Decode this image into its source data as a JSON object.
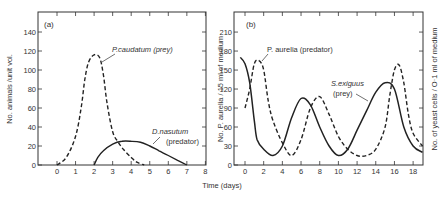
{
  "figure": {
    "xlabel": "Time (days)"
  },
  "chart_data": [
    {
      "type": "line",
      "panel_label": "(a)",
      "title": "",
      "xlabel": "Time (days)",
      "ylabel": "No. animals / unit vol.",
      "xlim": [
        -1,
        8
      ],
      "ylim": [
        0,
        160
      ],
      "xticks": [
        0,
        1,
        2,
        3,
        4,
        5,
        6,
        7,
        8
      ],
      "yticks": [
        0,
        20,
        40,
        60,
        80,
        100,
        120,
        140
      ],
      "grid": false,
      "series": [
        {
          "name": "P. caudatum (prey)",
          "style": "dashed",
          "x": [
            0,
            0.5,
            1.0,
            1.3,
            1.5,
            1.7,
            2.0,
            2.3,
            2.5,
            2.7,
            3.0,
            3.3,
            3.6,
            4.0,
            4.3,
            4.7
          ],
          "y": [
            0,
            8,
            30,
            60,
            90,
            108,
            116,
            113,
            95,
            65,
            35,
            24,
            16,
            8,
            3,
            0
          ]
        },
        {
          "name": "D. nasutum (predator)",
          "style": "solid",
          "x": [
            2.0,
            2.2,
            2.5,
            3.0,
            3.5,
            4.0,
            4.5,
            5.0,
            5.5,
            6.0,
            6.5,
            7.0
          ],
          "y": [
            0,
            8,
            15,
            22,
            25,
            25,
            24,
            20,
            15,
            10,
            5,
            0
          ]
        }
      ],
      "annotations": [
        {
          "text": "P. caudatum (prey)",
          "x": 3.0,
          "y": 120
        },
        {
          "text": "D. nasutum",
          "x": 5.5,
          "y": 30
        },
        {
          "text": "(predator)",
          "x": 6.0,
          "y": 21
        }
      ]
    },
    {
      "type": "line",
      "panel_label": "(b)",
      "title": "",
      "xlabel": "Time (days)",
      "ylabel": "No. P. aurelia / 15 ml of medium",
      "ylabel_right": "No. of yeast cells / 0·1 ml of medium",
      "xlim": [
        -1,
        19
      ],
      "ylim": [
        0,
        240
      ],
      "xticks": [
        0,
        2,
        4,
        6,
        8,
        10,
        12,
        14,
        16,
        18
      ],
      "yticks": [
        0,
        30,
        60,
        90,
        120,
        150,
        180,
        210
      ],
      "grid": false,
      "series": [
        {
          "name": "P. aurelia (predator)",
          "style": "solid",
          "x": [
            0,
            0.5,
            1.0,
            1.5,
            2.0,
            2.5,
            3.0,
            4.0,
            5.0,
            6.0,
            7.0,
            8.0,
            9.0,
            10.0,
            11.0,
            12.0,
            13.0,
            14.0,
            15.0,
            15.5,
            16.0,
            16.5,
            17.0,
            17.5,
            18.0,
            19.0
          ],
          "y": [
            90,
            120,
            160,
            165,
            150,
            100,
            70,
            35,
            15,
            40,
            90,
            108,
            80,
            45,
            25,
            15,
            15,
            25,
            60,
            110,
            150,
            158,
            130,
            80,
            50,
            30
          ]
        },
        {
          "name": "S. exiguus (prey)",
          "style": "dashed",
          "x": [
            -0.5,
            0,
            0.5,
            1.0,
            1.3,
            2.0,
            3.0,
            4.0,
            5.0,
            6.0,
            7.0,
            8.0,
            9.0,
            10.0,
            11.0,
            12.0,
            13.0,
            14.0,
            15.0,
            16.0,
            17.0,
            18.0,
            19.0
          ],
          "y": [
            170,
            160,
            130,
            70,
            40,
            25,
            15,
            30,
            75,
            105,
            95,
            60,
            30,
            15,
            25,
            55,
            85,
            115,
            130,
            120,
            60,
            30,
            20
          ]
        }
      ],
      "annotations": [
        {
          "text": "P. aurelia (predator)",
          "x": 3.5,
          "y": 180
        },
        {
          "text": "S. exiguus",
          "x": 15.0,
          "y": 115
        },
        {
          "text": "(prey)",
          "x": 14.5,
          "y": 100
        }
      ]
    }
  ],
  "panels": {
    "a": {
      "label": "(a)",
      "ylabel": "No. animals /unit vol.",
      "yticks": [
        "0",
        "20",
        "40",
        "60",
        "80",
        "100",
        "120",
        "140"
      ],
      "xticks": [
        "0",
        "1",
        "2",
        "3",
        "4",
        "5",
        "6",
        "7",
        "8"
      ],
      "prey_label": "P.caudatum (prey)",
      "predator_label_1": "D.nasutum",
      "predator_label_2": "(predator)"
    },
    "b": {
      "label": "(b)",
      "ylabel": "No. P. aurelia / 15 ml of medium",
      "ylabel_right": "No. of yeast cells / O·1 ml of medium",
      "yticks": [
        "0",
        "30",
        "60",
        "90",
        "120",
        "150",
        "180",
        "210"
      ],
      "xticks": [
        "0",
        "2",
        "4",
        "6",
        "8",
        "10",
        "12",
        "14",
        "16",
        "18"
      ],
      "predator_label": "P. aurelia (predator)",
      "prey_label_1": "S.exiguus",
      "prey_label_2": "(prey)"
    }
  }
}
